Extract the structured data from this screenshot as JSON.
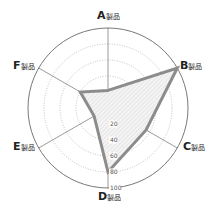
{
  "chart_data": {
    "type": "radar",
    "title": "",
    "categories": [
      "A製品",
      "B製品",
      "C製品",
      "D製品",
      "E製品",
      "F製品"
    ],
    "category_letters": [
      "A",
      "B",
      "C",
      "D",
      "E",
      "F"
    ],
    "category_suffix": "製品",
    "series": [
      {
        "name": "",
        "values": [
          22,
          100,
          55,
          80,
          20,
          40
        ]
      }
    ],
    "rlim": [
      0,
      100
    ],
    "r_ticks": [
      "20",
      "40",
      "60",
      "80",
      "100"
    ],
    "grid": true,
    "legend": false,
    "colors": {
      "line": "#8c8c8c",
      "fill": "#e6e6e6",
      "grid": "#9a9a9a",
      "axis": "#555555"
    }
  }
}
